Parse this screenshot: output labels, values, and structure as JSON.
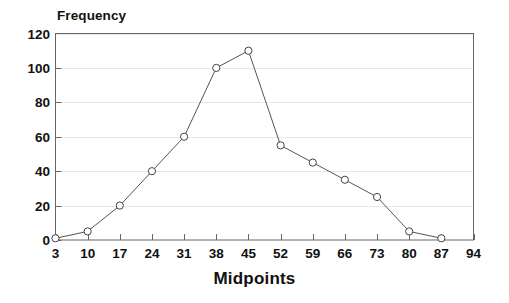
{
  "chart_data": {
    "type": "line",
    "title": "",
    "xlabel": "Midpoints",
    "ylabel": "Frequency",
    "x": [
      3,
      10,
      17,
      24,
      31,
      38,
      45,
      52,
      59,
      66,
      73,
      80,
      87
    ],
    "values": [
      1,
      5,
      20,
      40,
      60,
      100,
      110,
      55,
      45,
      35,
      25,
      5,
      1
    ],
    "categories": [
      "3",
      "10",
      "17",
      "24",
      "31",
      "38",
      "45",
      "52",
      "59",
      "66",
      "73",
      "80",
      "87"
    ],
    "xticks": [
      3,
      10,
      17,
      24,
      31,
      38,
      45,
      52,
      59,
      66,
      73,
      80,
      87,
      94
    ],
    "xtick_labels": [
      "3",
      "10",
      "17",
      "24",
      "31",
      "38",
      "45",
      "52",
      "59",
      "66",
      "73",
      "80",
      "87",
      "94"
    ],
    "yticks": [
      0,
      20,
      40,
      60,
      80,
      100,
      120
    ],
    "ytick_labels": [
      "0",
      "20",
      "40",
      "60",
      "80",
      "100",
      "120"
    ],
    "xlim": [
      3,
      94
    ],
    "ylim": [
      0,
      120
    ],
    "grid": true,
    "grid_axis": "y",
    "legend": false,
    "legend_position": "none",
    "marker": "open-circle",
    "series": [
      {
        "name": "Frequency",
        "values": [
          1,
          5,
          20,
          40,
          60,
          100,
          110,
          55,
          45,
          35,
          25,
          5,
          1
        ]
      }
    ],
    "colors": {
      "line": "#555555",
      "marker_edge": "#444444",
      "marker_face": "#ffffff",
      "grid": "#e8e8e8",
      "frame": "#666666",
      "text": "#111111",
      "background": "#ffffff"
    }
  }
}
